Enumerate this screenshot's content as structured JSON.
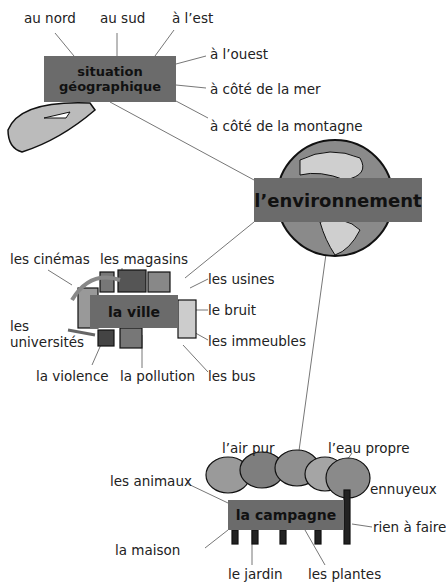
{
  "center": {
    "label": "l’environnement"
  },
  "topics": [
    {
      "id": "situation",
      "label_line1": "situation",
      "label_line2": "géographique",
      "items": [
        "au nord",
        "au sud",
        "à l’est",
        "à l’ouest",
        "à côté de la mer",
        "à côté de la montagne"
      ]
    },
    {
      "id": "ville",
      "label": "la ville",
      "items": [
        "les cinémas",
        "les magasins",
        "les usines",
        "le bruit",
        "les universités",
        "les immeubles",
        "la violence",
        "la pollution",
        "les bus"
      ]
    },
    {
      "id": "campagne",
      "label": "la campagne",
      "items": [
        "l’air pur",
        "l’eau propre",
        "les animaux",
        "ennuyeux",
        "rien à faire",
        "la maison",
        "le jardin",
        "les plantes"
      ]
    }
  ],
  "colors": {
    "box": "#6b6b6b",
    "line": "#666666",
    "text": "#222222"
  }
}
